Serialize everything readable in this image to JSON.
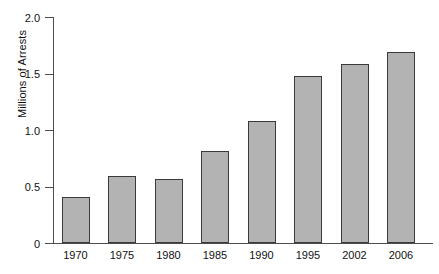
{
  "chart_data": {
    "type": "bar",
    "title": "",
    "xlabel": "",
    "ylabel": "Millions of Arrests",
    "categories": [
      "1970",
      "1975",
      "1980",
      "1985",
      "1990",
      "1995",
      "2002",
      "2006"
    ],
    "values": [
      0.41,
      0.59,
      0.57,
      0.81,
      1.08,
      1.48,
      1.58,
      1.69
    ],
    "ylim": [
      0,
      2.0
    ],
    "yticks": [
      0,
      0.5,
      1.0,
      1.5,
      2.0
    ],
    "ytick_labels": [
      "0",
      "0.5",
      "1.0",
      "1.5",
      "2.0"
    ],
    "grid": false,
    "legend": false,
    "series": [
      {
        "name": "Arrests",
        "values": [
          0.41,
          0.59,
          0.57,
          0.81,
          1.08,
          1.48,
          1.58,
          1.69
        ]
      }
    ],
    "colors": {
      "bar_fill": "#b3b3b3",
      "bar_edge": "#3a3a3a",
      "axis": "#4d4d4d",
      "text": "#111111",
      "background": "#ffffff"
    }
  }
}
